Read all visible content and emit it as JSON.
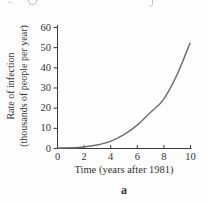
{
  "figure": {
    "sublabel": "a"
  },
  "chart_data": {
    "type": "line",
    "title": "",
    "xlabel": "Time (years after 1981)",
    "ylabel_line1": "Rate of infection",
    "ylabel_line2": "(thousands of people per year)",
    "x": [
      0,
      1,
      2,
      3,
      4,
      5,
      6,
      7,
      8,
      9,
      10
    ],
    "y": [
      0,
      0.1,
      0.5,
      1.5,
      3.3,
      6.5,
      11.2,
      17.5,
      24,
      36,
      52
    ],
    "xlim": [
      0,
      10
    ],
    "ylim": [
      0,
      60
    ],
    "xticks": [
      0,
      2,
      4,
      6,
      8,
      10
    ],
    "yticks": [
      0,
      10,
      20,
      30,
      40,
      50,
      60
    ],
    "grid": false,
    "legend": null,
    "series_name": "rate-of-infection",
    "curve_color": "#6e6e6e",
    "axis_color": "#3a3a3a",
    "text_color": "#333333"
  }
}
